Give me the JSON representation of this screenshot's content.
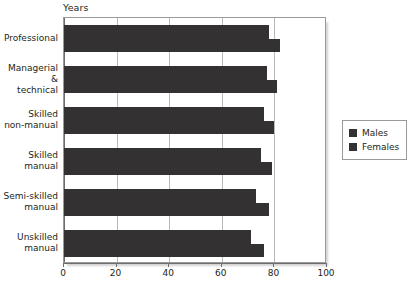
{
  "chart_data": {
    "type": "bar",
    "orientation": "horizontal",
    "title": "",
    "xlabel": "Years",
    "ylabel": "",
    "xlim": [
      0,
      100
    ],
    "xticks": [
      0,
      20,
      40,
      60,
      80,
      100
    ],
    "grid": true,
    "legend_position": "right",
    "categories": [
      "Professional",
      "Managerial &\ntechnical",
      "Skilled\nnon-manual",
      "Skilled manual",
      "Semi-skilled\nmanual",
      "Unskilled\nmanual"
    ],
    "series": [
      {
        "name": "Males",
        "color": "#333132",
        "values": [
          78,
          77,
          76,
          75,
          73,
          71
        ]
      },
      {
        "name": "Females",
        "color": "#333132",
        "values": [
          82,
          81,
          80,
          79,
          78,
          76
        ]
      }
    ]
  },
  "legend": {
    "items": [
      {
        "label": "Males"
      },
      {
        "label": "Females"
      }
    ]
  }
}
